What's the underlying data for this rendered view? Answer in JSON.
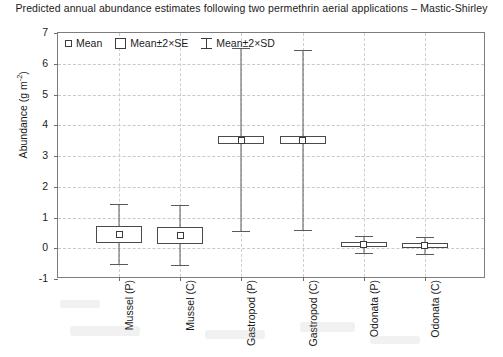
{
  "chart_data": {
    "type": "scatter",
    "title": "Predicted annual abundance estimates following two permethrin aerial applications – Mastic-Shirley",
    "xlabel": "",
    "ylabel": "Abundance (g m⁻²)",
    "ylabel_base": "Abundance (g m",
    "ylabel_exponent": "-2",
    "ylabel_close": ")",
    "ylim": [
      -1,
      7
    ],
    "yticks": [
      -1,
      0,
      1,
      2,
      3,
      4,
      5,
      6,
      7
    ],
    "ytick_labels": [
      "-1",
      "0",
      "1",
      "2",
      "3",
      "4",
      "5",
      "6",
      "7"
    ],
    "grid": "horizontal-and-vertical-dashed",
    "legend_position": "top-left-inside",
    "legend": [
      {
        "symbol": "small-square",
        "label_parts": [
          "Mean"
        ],
        "label": "Mean"
      },
      {
        "symbol": "box",
        "label": "Mean±2×SE"
      },
      {
        "symbol": "error-bar",
        "label": "Mean±2×SD"
      }
    ],
    "categories": [
      "Mussel (P)",
      "Mussel (C)",
      "Gastropod (P)",
      "Gastropod (C)",
      "Odonata (P)",
      "Odonata (C)"
    ],
    "series": [
      {
        "name": "Mean",
        "values": [
          0.45,
          0.42,
          3.52,
          3.52,
          0.12,
          0.1
        ]
      },
      {
        "name": "Mean±2×SE",
        "lower": [
          0.17,
          0.14,
          3.38,
          3.38,
          0.05,
          0.03
        ],
        "upper": [
          0.73,
          0.7,
          3.66,
          3.66,
          0.19,
          0.17
        ]
      },
      {
        "name": "Mean±2×SD",
        "lower": [
          -0.5,
          -0.53,
          0.55,
          0.6,
          -0.16,
          -0.18
        ],
        "upper": [
          1.45,
          1.4,
          6.5,
          6.45,
          0.4,
          0.38
        ]
      }
    ]
  },
  "colors": {
    "frame": "#7d7d7d",
    "grid": "#c9c9c9",
    "marker": "#4a4a4a",
    "text": "#1a1a1a",
    "background": "#ffffff"
  }
}
